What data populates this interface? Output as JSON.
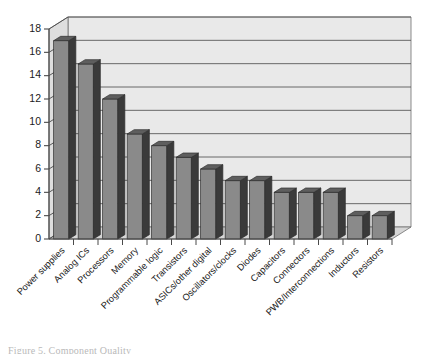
{
  "chart_data": {
    "type": "bar",
    "title": "",
    "subtitle": "",
    "xlabel": "",
    "ylabel": "",
    "categories": [
      "Power supplies",
      "Analog ICs",
      "Processors",
      "Memory",
      "Programmable logic",
      "Transistors",
      "ASICs/other digital",
      "Oscillators/clocks",
      "Diodes",
      "Capacitors",
      "Connectors",
      "PWB/Interconnections",
      "Inductors",
      "Resistors"
    ],
    "values": [
      17,
      15,
      12,
      9,
      8,
      7,
      6,
      5,
      5,
      4,
      4,
      4,
      2,
      2
    ],
    "ylim": [
      0,
      18
    ],
    "ytick_labels": [
      "0",
      "2",
      "4",
      "6",
      "8",
      "10",
      "12",
      "14",
      "16",
      "18"
    ],
    "ytick_values": [
      0,
      2,
      4,
      6,
      8,
      10,
      12,
      14,
      16,
      18
    ],
    "grid": true,
    "legend": false,
    "legend_position": "none",
    "style": "3d-column",
    "colors": {
      "bar_face": "#8a8a8a",
      "bar_side": "#3a3a3a",
      "bar_top": "#5e5e5e",
      "plot_background": "#e9e9e9",
      "floor": "#d8d8d8",
      "gridline": "#5a5a5a",
      "axis": "#4a4a4a",
      "text": "#1a1a1a"
    }
  },
  "caption": {
    "text": "Figure 5.  Component Quality"
  }
}
